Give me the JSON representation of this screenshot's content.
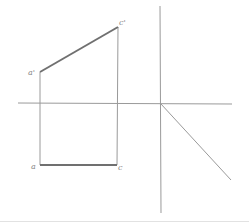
{
  "diagram": {
    "type": "orthographic-projection",
    "colors": {
      "thin_line": "#9a9a9a",
      "thick_line": "#707070",
      "label": "#888888"
    },
    "labels": {
      "a_prime": "a'",
      "c_prime": "c'",
      "a": "a",
      "c": "c"
    },
    "points": {
      "a_prime": [
        40,
        72
      ],
      "c_prime": [
        118,
        27
      ],
      "a": [
        40,
        165
      ],
      "c": [
        118,
        165
      ],
      "origin": [
        161,
        104
      ]
    }
  }
}
